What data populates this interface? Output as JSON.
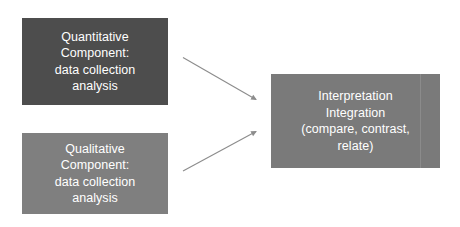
{
  "diagram": {
    "title_present": false,
    "background_color": "#ffffff",
    "boxes": [
      {
        "id": "quantitative",
        "fill": "#4d4d4d",
        "text_color": "#ffffff",
        "lines": [
          "Quantitative",
          "Component:",
          "data collection",
          "analysis"
        ]
      },
      {
        "id": "qualitative",
        "fill": "#7f7f7f",
        "text_color": "#ffffff",
        "lines": [
          "Qualitative",
          "Component:",
          "data collection",
          "analysis"
        ]
      },
      {
        "id": "interpretation",
        "fill": "#7a7a7a",
        "text_color": "#ffffff",
        "lines": [
          "Interpretation",
          "Integration",
          "(compare, contrast,",
          "relate)"
        ]
      }
    ],
    "arrows": [
      {
        "id": "quantitative-to-interpretation",
        "from": "quantitative",
        "to": "interpretation",
        "color": "#8c8c8c",
        "direction": "down-right"
      },
      {
        "id": "qualitative-to-interpretation",
        "from": "qualitative",
        "to": "interpretation",
        "color": "#8c8c8c",
        "direction": "up-right"
      }
    ]
  }
}
